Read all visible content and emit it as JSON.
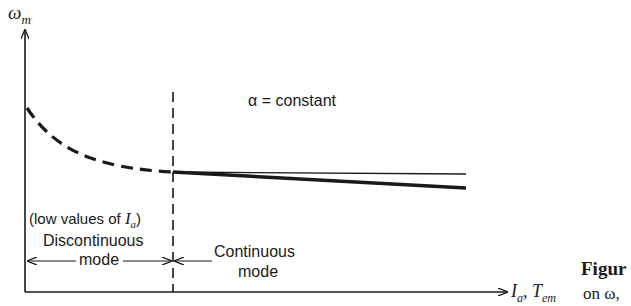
{
  "axes": {
    "y_label": "ω",
    "y_label_sub": "m",
    "x_label_1": "I",
    "x_label_1_sub": "a",
    "x_label_sep": ",",
    "x_label_2": "T",
    "x_label_2_sub": "em"
  },
  "annotations": {
    "alpha_label": "α = constant",
    "low_values": "(low values of ",
    "low_values_var": "I",
    "low_values_sub": "a",
    "low_values_close": ")",
    "discontinuous_line1": "Discontinuous",
    "discontinuous_line2": "mode",
    "continuous_line1": "Continuous",
    "continuous_line2": "mode"
  },
  "caption": {
    "title_fragment": "Figur",
    "text_fragment": "on ω,"
  },
  "colors": {
    "ink": "#1a1a1a",
    "background": "#ffffff"
  }
}
